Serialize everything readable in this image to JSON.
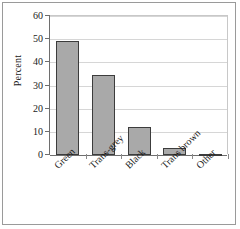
{
  "chart_data": {
    "type": "bar",
    "title": "",
    "xlabel": "",
    "ylabel": "Percent",
    "categories": [
      "Green",
      "Trans-grey",
      "Black",
      "Trans brown",
      "Other"
    ],
    "values": [
      49,
      34.5,
      12,
      3,
      0.5
    ],
    "ylim": [
      0,
      60
    ],
    "yticks": [
      0,
      10,
      20,
      30,
      40,
      50,
      60
    ],
    "ytick_labels": [
      "0",
      "10",
      "20",
      "30",
      "40",
      "50",
      "60"
    ],
    "grid": true,
    "legend": false,
    "legend_position": "none",
    "series": [
      {
        "name": "Percent",
        "values": [
          49,
          34.5,
          12,
          3,
          0.5
        ]
      }
    ],
    "bar_fill_color": "#a9a9a9",
    "bar_border_color": "#3c3c3c",
    "gridline_color": "#d6d6d6",
    "axis_color": "#6e6e6e",
    "frame_color": "#9a9a9a",
    "text_color": "#1a1a1a"
  }
}
